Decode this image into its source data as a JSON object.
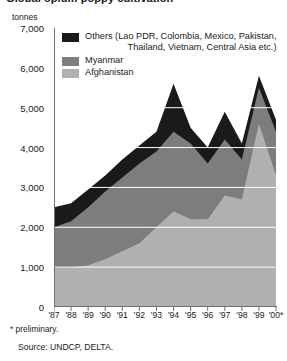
{
  "title": "Global opium poppy cultivation",
  "axis_unit": "tonnes",
  "legend": {
    "items": [
      {
        "name": "others",
        "label_line1": "Others (Lao PDR, Colombia, Mexico, Pakistan,",
        "label_line2": "Thailand, Vietnam, Central Asia etc.)",
        "color": "#1a1a1a"
      },
      {
        "name": "myanmar",
        "label_line1": "Myanmar",
        "label_line2": "",
        "color": "#7d7d7d"
      },
      {
        "name": "afghanistan",
        "label_line1": "Afghanistan",
        "label_line2": "",
        "color": "#b0b0b0"
      }
    ]
  },
  "footnote": "* preliminary.",
  "source": "Source: UNDCP, DELTA.",
  "chart_data": {
    "type": "area",
    "stacked": true,
    "title": "Global opium poppy cultivation",
    "xlabel": "",
    "ylabel": "tonnes",
    "ylim": [
      0,
      7000
    ],
    "yticks": [
      0,
      1000,
      2000,
      3000,
      4000,
      5000,
      6000,
      7000
    ],
    "ytick_labels": [
      "0",
      "1,000",
      "2,000",
      "3,000",
      "4,000",
      "5,000",
      "6,000",
      "7,000"
    ],
    "grid": true,
    "legend_position": "top-right",
    "categories": [
      "'87",
      "'88",
      "'89",
      "'90",
      "'91",
      "'92",
      "'93",
      "'94",
      "'95",
      "'96",
      "'97",
      "'98",
      "'99",
      "'00*"
    ],
    "series": [
      {
        "name": "Afghanistan",
        "color": "#b0b0b0",
        "values": [
          1000,
          1000,
          1050,
          1200,
          1400,
          1600,
          2000,
          2400,
          2200,
          2200,
          2800,
          2700,
          4600,
          3300
        ]
      },
      {
        "name": "Myanmar",
        "color": "#7d7d7d",
        "values": [
          1000,
          1150,
          1450,
          1700,
          1850,
          2000,
          1900,
          2000,
          1900,
          1400,
          1400,
          1000,
          900,
          1100
        ]
      },
      {
        "name": "Others",
        "color": "#1a1a1a",
        "values": [
          500,
          450,
          450,
          400,
          450,
          450,
          500,
          1200,
          400,
          400,
          700,
          400,
          300,
          300
        ]
      }
    ],
    "totals": [
      2500,
      2600,
      2950,
      3300,
      3700,
      4050,
      4400,
      5600,
      4500,
      4000,
      4900,
      4100,
      5800,
      4700
    ]
  }
}
